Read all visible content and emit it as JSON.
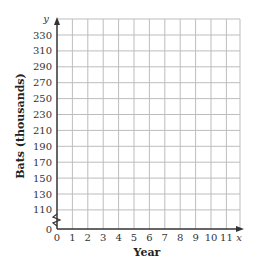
{
  "chart_data": {
    "type": "line",
    "title": "",
    "xlabel": "Year",
    "ylabel": "Bats (thousands)",
    "x_axis_var": "x",
    "y_axis_var": "y",
    "x_ticks": [
      "0",
      "1",
      "2",
      "3",
      "4",
      "5",
      "6",
      "7",
      "8",
      "9",
      "10",
      "11"
    ],
    "y_ticks": [
      "0",
      "110",
      "130",
      "150",
      "170",
      "190",
      "210",
      "230",
      "250",
      "270",
      "290",
      "310",
      "330"
    ],
    "xlim": [
      0,
      11
    ],
    "ylim": [
      0,
      330
    ],
    "y_axis_break": true,
    "grid": true,
    "series": [],
    "legend": null
  },
  "colors": {
    "grid": "#bdbdbd",
    "axis": "#333333"
  }
}
